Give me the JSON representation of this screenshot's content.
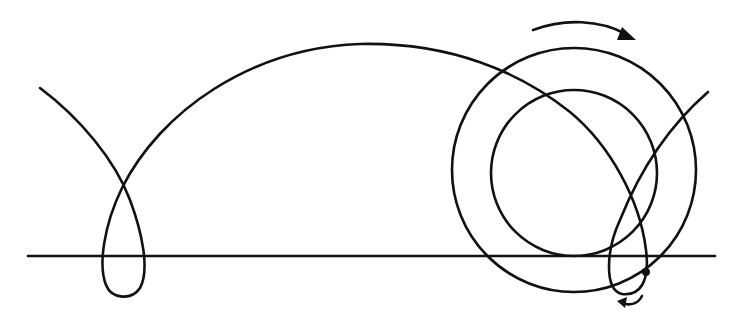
{
  "figure": {
    "type": "prolate-trochoid-diagram",
    "colors": {
      "ink": "#111111",
      "background": "#ffffff"
    },
    "baseline": {
      "x1": 28,
      "x2": 715,
      "y": 256
    },
    "wheel": {
      "outer_circle": {
        "cx": 574,
        "cy": 170,
        "r": 122
      },
      "inner_circle": {
        "cx": 574,
        "cy": 173,
        "r": 83
      }
    },
    "tracing_point": {
      "cx": 646,
      "cy": 272,
      "r": 4
    },
    "rotation_arrow_top": {
      "direction": "clockwise",
      "icon": "curved-arrow-right"
    },
    "rotation_arrow_bottom": {
      "direction": "leftward",
      "icon": "curved-arrow-left"
    }
  }
}
